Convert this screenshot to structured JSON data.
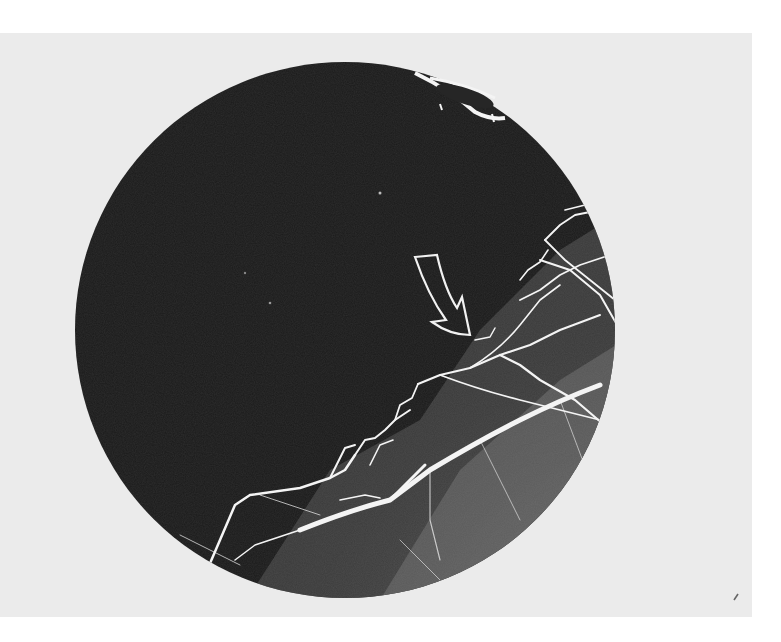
{
  "figure": {
    "type": "fluorescein-angiogram-fundus-photograph",
    "colors": {
      "page_background": "#ffffff",
      "photo_background": "#ebebeb",
      "fundus_dark": "#1a1a1a",
      "perfused_region": "#5a5a5a",
      "vessel": "#f4f4f4",
      "arrow_outline": "#f2f2f2"
    },
    "annotations": [
      {
        "kind": "outlined-arrow",
        "direction": "down-right",
        "label": ""
      }
    ]
  }
}
